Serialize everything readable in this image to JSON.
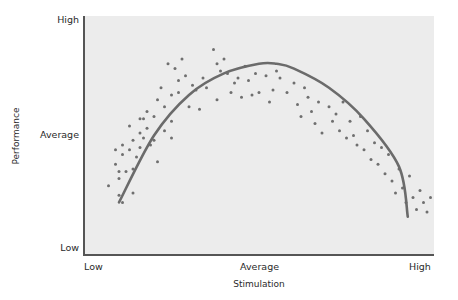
{
  "chart_data": {
    "type": "scatter",
    "title": "",
    "xlabel": "Stimulation",
    "ylabel": "Performance",
    "x_tick_labels": [
      "Low",
      "Average",
      "High"
    ],
    "y_tick_labels": [
      "Low",
      "Average",
      "High"
    ],
    "xlim": [
      0,
      100
    ],
    "ylim": [
      0,
      100
    ],
    "grid": false,
    "legend": null,
    "annotations": [],
    "series": [
      {
        "name": "observations",
        "kind": "scatter",
        "color": "#6f6f6f",
        "points": [
          [
            7,
            29
          ],
          [
            9,
            44
          ],
          [
            9,
            38
          ],
          [
            10,
            35
          ],
          [
            10,
            32
          ],
          [
            10,
            25
          ],
          [
            11,
            46
          ],
          [
            11,
            42
          ],
          [
            11,
            22
          ],
          [
            12,
            35
          ],
          [
            13,
            54
          ],
          [
            13,
            44
          ],
          [
            14,
            48
          ],
          [
            14,
            36
          ],
          [
            14,
            26
          ],
          [
            15,
            41
          ],
          [
            16,
            57
          ],
          [
            16,
            51
          ],
          [
            16,
            45
          ],
          [
            17,
            57
          ],
          [
            17,
            49
          ],
          [
            18,
            53
          ],
          [
            18,
            60
          ],
          [
            19,
            46
          ],
          [
            20,
            58
          ],
          [
            20,
            48
          ],
          [
            21,
            65
          ],
          [
            21,
            39
          ],
          [
            22,
            70
          ],
          [
            23,
            52
          ],
          [
            23,
            62
          ],
          [
            24,
            80
          ],
          [
            25,
            67
          ],
          [
            25,
            56
          ],
          [
            25,
            49
          ],
          [
            26,
            78
          ],
          [
            27,
            68
          ],
          [
            27,
            73
          ],
          [
            28,
            82
          ],
          [
            29,
            75
          ],
          [
            30,
            62
          ],
          [
            31,
            71
          ],
          [
            32,
            69
          ],
          [
            33,
            61
          ],
          [
            34,
            74
          ],
          [
            35,
            70
          ],
          [
            37,
            86
          ],
          [
            38,
            80
          ],
          [
            38,
            65
          ],
          [
            39,
            77
          ],
          [
            40,
            82
          ],
          [
            41,
            76
          ],
          [
            42,
            68
          ],
          [
            43,
            72
          ],
          [
            44,
            74
          ],
          [
            45,
            66
          ],
          [
            46,
            79
          ],
          [
            47,
            73
          ],
          [
            48,
            67
          ],
          [
            49,
            76
          ],
          [
            50,
            68
          ],
          [
            52,
            75
          ],
          [
            53,
            64
          ],
          [
            54,
            69
          ],
          [
            55,
            77
          ],
          [
            56,
            74
          ],
          [
            58,
            68
          ],
          [
            60,
            72
          ],
          [
            61,
            63
          ],
          [
            62,
            58
          ],
          [
            63,
            70
          ],
          [
            64,
            66
          ],
          [
            65,
            60
          ],
          [
            66,
            55
          ],
          [
            67,
            64
          ],
          [
            68,
            51
          ],
          [
            70,
            62
          ],
          [
            71,
            56
          ],
          [
            72,
            59
          ],
          [
            73,
            52
          ],
          [
            74,
            64
          ],
          [
            75,
            49
          ],
          [
            76,
            56
          ],
          [
            77,
            50
          ],
          [
            78,
            46
          ],
          [
            79,
            58
          ],
          [
            80,
            44
          ],
          [
            81,
            52
          ],
          [
            82,
            40
          ],
          [
            83,
            47
          ],
          [
            84,
            38
          ],
          [
            85,
            45
          ],
          [
            86,
            34
          ],
          [
            87,
            42
          ],
          [
            88,
            31
          ],
          [
            89,
            26
          ],
          [
            90,
            36
          ],
          [
            91,
            28
          ],
          [
            92,
            22
          ],
          [
            93,
            33
          ],
          [
            94,
            24
          ],
          [
            95,
            19
          ],
          [
            96,
            27
          ],
          [
            97,
            22
          ],
          [
            98,
            18
          ],
          [
            99,
            24
          ]
        ]
      },
      {
        "name": "inverted-U fit",
        "kind": "line",
        "color": "#6b6b6b",
        "x": [
          10,
          20,
          30,
          40,
          50,
          55,
          60,
          70,
          80,
          90,
          92.5
        ],
        "y": [
          22,
          50,
          67,
          76,
          80,
          80,
          78,
          70,
          57,
          37,
          16
        ]
      }
    ]
  },
  "axes": {
    "y_high": "High",
    "y_average": "Average",
    "y_low": "Low",
    "x_low": "Low",
    "x_average": "Average",
    "x_high": "High",
    "x_title": "Stimulation",
    "y_title": "Performance"
  },
  "style": {
    "plot_bg": "#ececec",
    "point_color": "#6f6f6f",
    "curve_color": "#6b6b6b",
    "axis_color": "#555555"
  }
}
